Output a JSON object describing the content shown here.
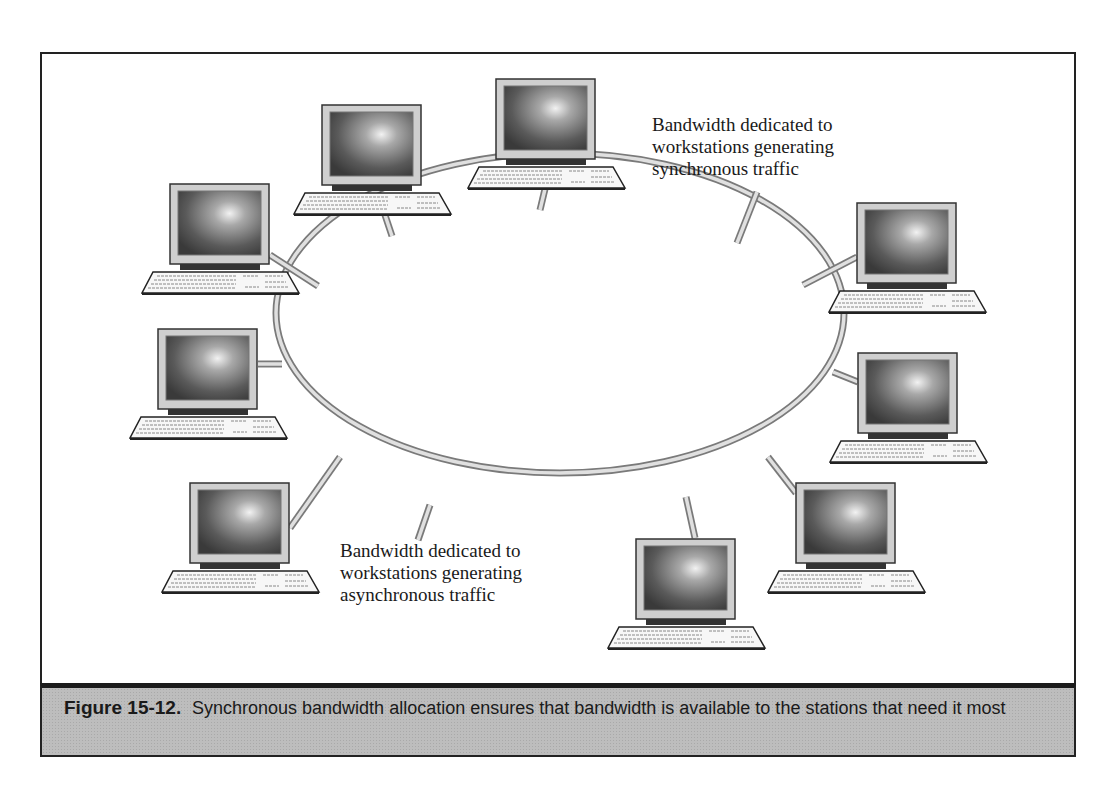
{
  "figure": {
    "number": "Figure 15-12.",
    "caption": "Synchronous bandwidth allocation ensures that bandwidth is available to the stations that need it most"
  },
  "labels": {
    "synchronous": "Bandwidth dedicated to\nworkstations generating\nsynchronous traffic",
    "asynchronous": "Bandwidth dedicated to\nworkstations generating\nasynchronous traffic"
  },
  "diagram": {
    "ring": {
      "cx": 560,
      "cy": 313,
      "rx": 284,
      "ry": 160
    },
    "workstations": [
      {
        "id": "ws-1",
        "x": 322,
        "y": 104,
        "spoke": [
          [
            385,
            215
          ],
          [
            392,
            236
          ]
        ]
      },
      {
        "id": "ws-2",
        "x": 496,
        "y": 78,
        "spoke": [
          [
            545,
            189
          ],
          [
            540,
            210
          ]
        ]
      },
      {
        "id": "ws-3",
        "x": 170,
        "y": 183,
        "spoke": [
          [
            270,
            255
          ],
          [
            318,
            286
          ]
        ]
      },
      {
        "id": "ws-4",
        "x": 857,
        "y": 202,
        "spoke": [
          [
            857,
            257
          ],
          [
            803,
            285
          ]
        ]
      },
      {
        "id": "ws-5",
        "x": 158,
        "y": 328,
        "spoke": [
          [
            258,
            364
          ],
          [
            282,
            364
          ]
        ]
      },
      {
        "id": "ws-6",
        "x": 858,
        "y": 352,
        "spoke": [
          [
            858,
            382
          ],
          [
            833,
            372
          ]
        ]
      },
      {
        "id": "ws-7",
        "x": 190,
        "y": 482,
        "spoke": [
          [
            290,
            528
          ],
          [
            340,
            457
          ]
        ]
      },
      {
        "id": "ws-8",
        "x": 796,
        "y": 482,
        "spoke": [
          [
            796,
            493
          ],
          [
            768,
            457
          ]
        ]
      },
      {
        "id": "ws-9",
        "x": 636,
        "y": 538,
        "spoke": [
          [
            695,
            538
          ],
          [
            686,
            497
          ]
        ]
      }
    ],
    "extra_workstation": {
      "id": "ws-10",
      "x": 496,
      "y": 78
    },
    "label_spokes": [
      [
        [
          757,
          192
        ],
        [
          737,
          243
        ]
      ],
      [
        [
          430,
          505
        ],
        [
          418,
          540
        ]
      ]
    ]
  }
}
